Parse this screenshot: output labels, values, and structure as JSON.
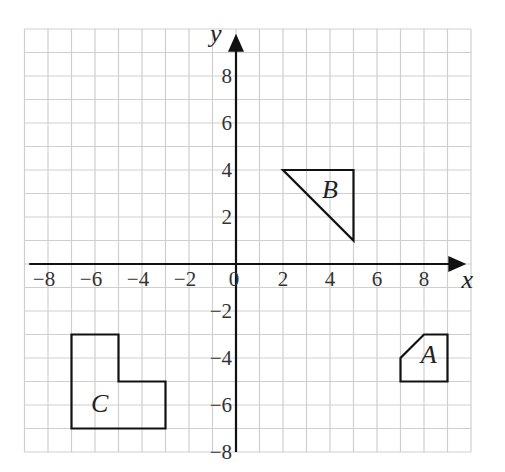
{
  "diagram": {
    "type": "coordinate-grid",
    "grid": {
      "x_range": [
        -9,
        10
      ],
      "y_range": [
        -8,
        10
      ],
      "step": 1
    },
    "axes": {
      "x": {
        "label": "x",
        "ticks": [
          -8,
          -6,
          -4,
          -2,
          0,
          2,
          4,
          6,
          8
        ]
      },
      "y": {
        "label": "y",
        "ticks": [
          8,
          6,
          4,
          2,
          -2,
          -4,
          -6,
          -8
        ]
      }
    },
    "tick_labels": {
      "x": [
        "−8",
        "−6",
        "−4",
        "−2",
        "0",
        "2",
        "4",
        "6",
        "8"
      ],
      "y": [
        "8",
        "6",
        "4",
        "2",
        "−2",
        "−4",
        "−6",
        "−8"
      ]
    },
    "shapes": [
      {
        "name": "A",
        "label": "A",
        "vertices": [
          [
            7,
            -5
          ],
          [
            9,
            -5
          ],
          [
            9,
            -3
          ],
          [
            8,
            -3
          ],
          [
            7,
            -4
          ]
        ],
        "label_at": [
          8.2,
          -4.2
        ]
      },
      {
        "name": "B",
        "label": "B",
        "vertices": [
          [
            2,
            4
          ],
          [
            5,
            4
          ],
          [
            5,
            1
          ]
        ],
        "label_at": [
          4.0,
          2.8
        ]
      },
      {
        "name": "C",
        "label": "C",
        "vertices": [
          [
            -7,
            -3
          ],
          [
            -5,
            -3
          ],
          [
            -5,
            -5
          ],
          [
            -3,
            -5
          ],
          [
            -3,
            -7
          ],
          [
            -7,
            -7
          ]
        ],
        "label_at": [
          -5.8,
          -6.3
        ]
      }
    ],
    "colors": {
      "grid": "#cfcfcf",
      "axis": "#111111",
      "shape_stroke": "#111111"
    }
  }
}
